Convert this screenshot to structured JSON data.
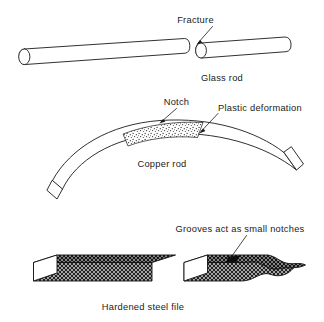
{
  "figure": {
    "background_color": "#ffffff",
    "ink_color": "#1a1a1a",
    "panels": [
      {
        "id": "glass-rod",
        "caption": "Glass rod",
        "annotations": [
          {
            "id": "fracture",
            "label": "Fracture"
          }
        ]
      },
      {
        "id": "copper-rod",
        "caption": "Copper rod",
        "annotations": [
          {
            "id": "notch",
            "label": "Notch"
          },
          {
            "id": "plastic-deformation",
            "label": "Plastic deformation"
          }
        ]
      },
      {
        "id": "steel-file",
        "caption": "Hardened steel file",
        "annotations": [
          {
            "id": "grooves",
            "label": "Grooves act as small notches"
          }
        ]
      }
    ]
  },
  "labels": {
    "fracture": "Fracture",
    "glass_rod": "Glass rod",
    "notch": "Notch",
    "plastic_deformation": "Plastic deformation",
    "copper_rod": "Copper rod",
    "grooves_act_as_small_notches": "Grooves act as small notches",
    "hardened_steel_file": "Hardened steel file"
  }
}
